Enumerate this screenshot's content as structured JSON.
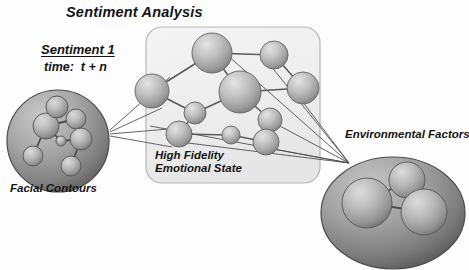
{
  "figure": {
    "title": "Sentiment Analysis",
    "background_color": "#fdfdfd",
    "text_color": "#141414",
    "sphere_light": "#d8d8d8",
    "sphere_mid": "#a9a9a9",
    "sphere_dark": "#6e6e6e",
    "disc_light": "#b4b4b4",
    "disc_dark": "#5a5a5a",
    "panel_fill": "#efefef",
    "panel_stroke": "#b8b8b8",
    "edge_stroke": "#555555"
  },
  "labels": {
    "sentiment_heading": "Sentiment 1",
    "time_line": "time:  t + n",
    "facial_contours": "Facial Contours",
    "high_fidelity_line1": "High Fidelity",
    "high_fidelity_line2": "Emotional State",
    "environmental_factors": "Environmental Factors"
  },
  "diagram_data": {
    "type": "node-link-diagram",
    "groups": [
      {
        "id": "facial-contours",
        "label": "Facial Contours",
        "shape": "circle",
        "cx": 58,
        "cy": 141,
        "r": 51,
        "nodes": [
          {
            "id": "fc1",
            "cx": 46,
            "cy": 126,
            "r": 13
          },
          {
            "id": "fc2",
            "cx": 57,
            "cy": 107,
            "r": 11
          },
          {
            "id": "fc3",
            "cx": 76,
            "cy": 119,
            "r": 10
          },
          {
            "id": "fc4",
            "cx": 81,
            "cy": 139,
            "r": 11
          },
          {
            "id": "fc5",
            "cx": 61,
            "cy": 141,
            "r": 5
          },
          {
            "id": "fc6",
            "cx": 33,
            "cy": 156,
            "r": 10
          },
          {
            "id": "fc7",
            "cx": 71,
            "cy": 166,
            "r": 10
          }
        ],
        "edges": [
          [
            "fc1",
            "fc2"
          ],
          [
            "fc1",
            "fc3"
          ],
          [
            "fc1",
            "fc5"
          ],
          [
            "fc1",
            "fc6"
          ],
          [
            "fc3",
            "fc4"
          ],
          [
            "fc4",
            "fc5"
          ],
          [
            "fc4",
            "fc7"
          ]
        ]
      },
      {
        "id": "high-fidelity-emotional-state",
        "label": "High Fidelity Emotional State",
        "shape": "rounded-rect",
        "x": 146,
        "y": 27,
        "w": 174,
        "h": 156,
        "r": 16,
        "nodes": [
          {
            "id": "hf1",
            "cx": 212,
            "cy": 53,
            "r": 20
          },
          {
            "id": "hf2",
            "cx": 274,
            "cy": 55,
            "r": 14
          },
          {
            "id": "hf3",
            "cx": 152,
            "cy": 91,
            "r": 17
          },
          {
            "id": "hf4",
            "cx": 240,
            "cy": 92,
            "r": 21
          },
          {
            "id": "hf5",
            "cx": 303,
            "cy": 88,
            "r": 16
          },
          {
            "id": "hf6",
            "cx": 195,
            "cy": 113,
            "r": 11
          },
          {
            "id": "hf7",
            "cx": 179,
            "cy": 134,
            "r": 13
          },
          {
            "id": "hf8",
            "cx": 231,
            "cy": 135,
            "r": 9
          },
          {
            "id": "hf9",
            "cx": 270,
            "cy": 120,
            "r": 12
          },
          {
            "id": "hf10",
            "cx": 266,
            "cy": 142,
            "r": 13
          }
        ],
        "edges": [
          [
            "hf1",
            "hf2"
          ],
          [
            "hf1",
            "hf3"
          ],
          [
            "hf1",
            "hf4"
          ],
          [
            "hf2",
            "hf5"
          ],
          [
            "hf3",
            "hf6"
          ],
          [
            "hf4",
            "hf5"
          ],
          [
            "hf4",
            "hf6"
          ],
          [
            "hf4",
            "hf9"
          ],
          [
            "hf6",
            "hf7"
          ],
          [
            "hf7",
            "hf8"
          ],
          [
            "hf8",
            "hf10"
          ],
          [
            "hf9",
            "hf10"
          ]
        ]
      },
      {
        "id": "environmental-factors",
        "label": "Environmental Factors",
        "shape": "ellipse",
        "cx": 393,
        "cy": 213,
        "rx": 72,
        "ry": 56,
        "nodes": [
          {
            "id": "ef1",
            "cx": 367,
            "cy": 203,
            "r": 25
          },
          {
            "id": "ef2",
            "cx": 407,
            "cy": 180,
            "r": 18
          },
          {
            "id": "ef3",
            "cx": 424,
            "cy": 212,
            "r": 23
          }
        ],
        "edges": [
          [
            "ef1",
            "ef2"
          ],
          [
            "ef1",
            "ef3"
          ],
          [
            "ef2",
            "ef3"
          ]
        ]
      }
    ],
    "cross_links": {
      "left_fan_origin": {
        "x": 110,
        "y": 132
      },
      "left_fan_targets": [
        {
          "x": 168,
          "y": 79
        },
        {
          "x": 160,
          "y": 110
        },
        {
          "x": 166,
          "y": 130
        },
        {
          "x": 170,
          "y": 148
        }
      ],
      "right_fan_convergence": {
        "x": 349,
        "y": 163
      },
      "right_fan_origins": [
        {
          "x": 225,
          "y": 55
        },
        {
          "x": 266,
          "y": 60
        },
        {
          "x": 296,
          "y": 92
        },
        {
          "x": 276,
          "y": 126
        },
        {
          "x": 262,
          "y": 146
        },
        {
          "x": 175,
          "y": 142
        },
        {
          "x": 150,
          "y": 128
        }
      ]
    }
  }
}
